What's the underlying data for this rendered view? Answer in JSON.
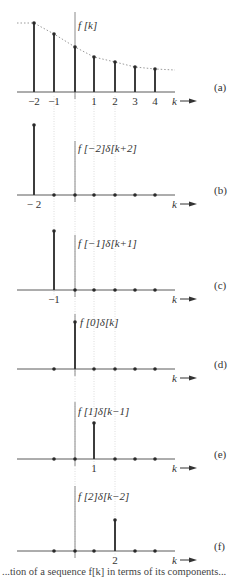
{
  "figure": {
    "x_positions": {
      "-2": 34,
      "-1": 54,
      "0": 75,
      "1": 94,
      "2": 115,
      "3": 135,
      "4": 155
    },
    "axis_x_range": [
      17,
      175
    ],
    "axis_label": "k",
    "caption_partial": "...tion of a sequence f[k] in terms of its components..."
  },
  "panels": [
    {
      "id": "a",
      "tag": "(a)",
      "title": "f [k]",
      "axis_y": 92,
      "vaxis_top": 12,
      "title_pos": [
        78,
        29
      ],
      "tick_labels": [
        {
          "k": -2,
          "text": "−2"
        },
        {
          "k": -1,
          "text": "−1"
        },
        {
          "k": 1,
          "text": "1"
        },
        {
          "k": 2,
          "text": "2"
        },
        {
          "k": 3,
          "text": "3"
        },
        {
          "k": 4,
          "text": "4"
        }
      ],
      "stems": [
        {
          "k": -2,
          "top": 23
        },
        {
          "k": -1,
          "top": 34
        },
        {
          "k": 0,
          "top": 47
        },
        {
          "k": 1,
          "top": 57
        },
        {
          "k": 2,
          "top": 62
        },
        {
          "k": 3,
          "top": 67
        },
        {
          "k": 4,
          "top": 69
        }
      ],
      "zero_dots": []
    },
    {
      "id": "b",
      "tag": "(b)",
      "title": "f [−2]δ[k+2]",
      "axis_y": 195,
      "vaxis_top": 141,
      "title_pos": [
        78,
        152
      ],
      "tick_labels": [
        {
          "k": -2,
          "text": "− 2"
        }
      ],
      "stems": [
        {
          "k": -2,
          "top": 125
        }
      ],
      "zero_dots": [
        -1,
        0,
        1,
        2,
        3,
        4
      ]
    },
    {
      "id": "c",
      "tag": "(c)",
      "title": "f [−1]δ[k+1]",
      "axis_y": 290,
      "vaxis_top": 235,
      "title_pos": [
        78,
        247
      ],
      "tick_labels": [
        {
          "k": -1,
          "text": "−1"
        }
      ],
      "stems": [
        {
          "k": -1,
          "top": 231
        }
      ],
      "zero_dots": [
        0,
        1,
        2,
        3,
        4
      ]
    },
    {
      "id": "d",
      "tag": "(d)",
      "title": "f [0]δ[k]",
      "axis_y": 369,
      "vaxis_top": 314,
      "title_pos": [
        80,
        326
      ],
      "tick_labels": [],
      "stems": [
        {
          "k": 0,
          "top": 322
        }
      ],
      "zero_dots": [
        -1,
        1,
        2,
        3,
        4
      ]
    },
    {
      "id": "e",
      "tag": "(e)",
      "title": "f [1]δ[k−1]",
      "axis_y": 459,
      "vaxis_top": 402,
      "title_pos": [
        78,
        415
      ],
      "tick_labels": [
        {
          "k": 1,
          "text": "1"
        }
      ],
      "stems": [
        {
          "k": 1,
          "top": 423
        }
      ],
      "zero_dots": [
        -1,
        0,
        2,
        3,
        4
      ]
    },
    {
      "id": "f",
      "tag": "(f)",
      "title": "f [2]δ[k−2]",
      "axis_y": 551,
      "vaxis_top": 486,
      "title_pos": [
        78,
        500
      ],
      "tick_labels": [
        {
          "k": 2,
          "text": "2"
        }
      ],
      "stems": [
        {
          "k": 2,
          "top": 520
        }
      ],
      "zero_dots": [
        -1,
        0,
        1,
        3,
        4
      ]
    }
  ],
  "guides": [
    {
      "k": -1,
      "from": 96,
      "to": 295
    },
    {
      "k": 0,
      "from": 96,
      "to": 555
    },
    {
      "k": 1,
      "from": 96,
      "to": 465
    },
    {
      "k": 2,
      "from": 96,
      "to": 555
    }
  ]
}
